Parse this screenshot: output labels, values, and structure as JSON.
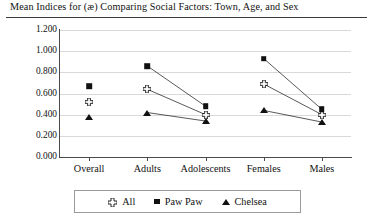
{
  "chart_data": {
    "type": "line",
    "title": "Mean Indices for (æ) Comparing Social Factors: Town, Age, and Sex",
    "xlabel": "",
    "ylabel": "Index",
    "categories": [
      "Overall",
      "Adults",
      "Adolescents",
      "Females",
      "Males"
    ],
    "ylim": [
      0.0,
      1.2
    ],
    "ytick_labels": [
      "0.000",
      "0.200",
      "0.400",
      "0.600",
      "0.800",
      "1.000",
      "1.200"
    ],
    "ytick_values": [
      0.0,
      0.2,
      0.4,
      0.6,
      0.8,
      1.0,
      1.2
    ],
    "grid": true,
    "legend_position": "bottom",
    "series": [
      {
        "name": "All",
        "marker": "outlined-cross",
        "values": [
          0.52,
          0.64,
          0.4,
          0.69,
          0.4
        ],
        "connected_pairs": [
          [
            "Adults",
            "Adolescents"
          ],
          [
            "Females",
            "Males"
          ]
        ]
      },
      {
        "name": "Paw Paw",
        "marker": "filled-square",
        "values": [
          0.67,
          0.86,
          0.48,
          0.93,
          0.45
        ],
        "connected_pairs": [
          [
            "Adults",
            "Adolescents"
          ],
          [
            "Females",
            "Males"
          ]
        ]
      },
      {
        "name": "Chelsea",
        "marker": "filled-triangle",
        "values": [
          0.38,
          0.42,
          0.34,
          0.44,
          0.33
        ],
        "connected_pairs": [
          [
            "Adults",
            "Adolescents"
          ],
          [
            "Females",
            "Males"
          ]
        ]
      }
    ]
  },
  "chart": {
    "title": "Mean Indices for (æ) Comparing Social Factors: Town, Age, and Sex",
    "ylabel": "Index",
    "yticks": [
      "1.200",
      "1.000",
      "0.800",
      "0.600",
      "0.400",
      "0.200",
      "0.000"
    ],
    "xticks": [
      "Overall",
      "Adults",
      "Adolescents",
      "Females",
      "Males"
    ],
    "legend": [
      {
        "label": "All",
        "marker": "outlined-cross"
      },
      {
        "label": "Paw Paw",
        "marker": "filled-square"
      },
      {
        "label": "Chelsea",
        "marker": "filled-triangle"
      }
    ],
    "colors": {
      "ink": "#111111",
      "grid": "#d9d9d9",
      "axis": "#4a4a4a"
    }
  }
}
